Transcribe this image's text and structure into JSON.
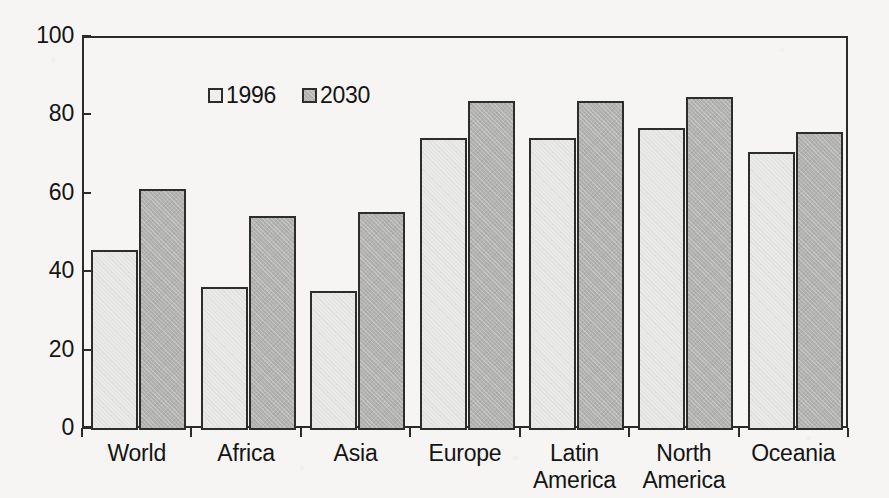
{
  "chart_data": {
    "type": "bar",
    "title": "",
    "subtitle": "",
    "xlabel": "",
    "ylabel": "",
    "ylim": [
      0,
      100
    ],
    "yticks": [
      "0",
      "20",
      "40",
      "60",
      "80",
      "100"
    ],
    "grid": false,
    "legend_position": "inside top-left",
    "categories": [
      "World",
      "Africa",
      "Asia",
      "Europe",
      "Latin\nAmerica",
      "North\nAmerica",
      "Oceania"
    ],
    "category_lines": [
      [
        "World",
        ""
      ],
      [
        "Africa",
        ""
      ],
      [
        "Asia",
        ""
      ],
      [
        "Europe",
        ""
      ],
      [
        "Latin",
        "America"
      ],
      [
        "North",
        "America"
      ],
      [
        "Oceania",
        ""
      ]
    ],
    "series": [
      {
        "name": "1996",
        "color": "#e9e9e7",
        "values": [
          46,
          36.5,
          35.5,
          74.5,
          74.5,
          77,
          71
        ]
      },
      {
        "name": "2030",
        "color": "#b3b3b1",
        "values": [
          61.5,
          54.5,
          55.5,
          84,
          84,
          85,
          76
        ]
      }
    ]
  },
  "legend": {
    "entries": [
      {
        "label": "1996",
        "swatch": "light-gray-square"
      },
      {
        "label": "2030",
        "swatch": "medium-gray-square"
      }
    ]
  },
  "colors": {
    "background": "#f6f5f3",
    "axis": "#2b2b2b",
    "text": "#141414",
    "series_1996": "#e9e9e7",
    "series_2030": "#b3b3b1"
  }
}
